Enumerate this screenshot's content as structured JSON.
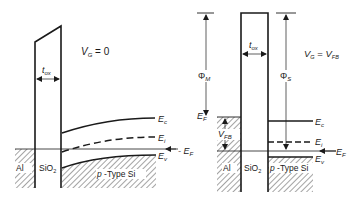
{
  "diagrams": [
    {
      "id": "left",
      "condition": {
        "lhs": "V",
        "lhs_sub": "G",
        "rhs": "0",
        "full": "V_G = 0"
      },
      "oxide_thickness_label": {
        "main": "t",
        "sub": "ox"
      },
      "band_labels": {
        "Ec": {
          "main": "E",
          "sub": "c"
        },
        "Ei": {
          "main": "E",
          "sub": "i"
        },
        "Ev": {
          "main": "E",
          "sub": "v"
        },
        "EF": {
          "main": "E",
          "sub": "F"
        }
      },
      "region_labels": {
        "metal": "Al",
        "oxide_main": "SiO",
        "oxide_sub": "2",
        "semiconductor": "p -Type Si"
      }
    },
    {
      "id": "right",
      "condition": {
        "lhs": "V",
        "lhs_sub": "G",
        "rhs": "V",
        "rhs_sub": "FB",
        "full": "V_G = V_FB"
      },
      "oxide_thickness_label": {
        "main": "t",
        "sub": "ox"
      },
      "work_functions": {
        "metal": {
          "main": "Φ",
          "sub": "M"
        },
        "semiconductor": {
          "main": "Φ",
          "sub": "S"
        }
      },
      "flatband_label": {
        "main": "V",
        "sub": "FB"
      },
      "band_labels": {
        "EF_metal": {
          "main": "E",
          "sub": "F"
        },
        "EF_left": {
          "main": "E",
          "sub": "F"
        },
        "Ec": {
          "main": "E",
          "sub": "c"
        },
        "Ei": {
          "main": "E",
          "sub": "i"
        },
        "Ev": {
          "main": "E",
          "sub": "v"
        },
        "EF": {
          "main": "E",
          "sub": "F"
        }
      },
      "region_labels": {
        "metal": "Al",
        "oxide_main": "SiO",
        "oxide_sub": "2",
        "semiconductor": "p -Type Si"
      }
    }
  ],
  "colors": {
    "line": "#1a1a1a",
    "background": "#ffffff"
  }
}
